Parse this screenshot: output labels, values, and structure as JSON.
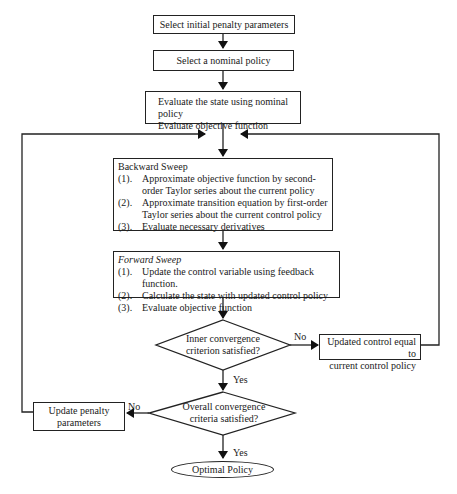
{
  "flowchart": {
    "start": "Select initial penalty parameters",
    "nominal": "Select a nominal policy",
    "evaluate": {
      "line1": "Evaluate the state using nominal policy",
      "line2": "Evaluate objective function"
    },
    "backward": {
      "title": "Backward Sweep",
      "items": [
        {
          "num": "(1).",
          "text": "Approximate objective function by second-order Taylor series about the current policy"
        },
        {
          "num": "(2).",
          "text": "Approximate transition equation by first-order Taylor series about the current control policy"
        },
        {
          "num": "(3).",
          "text": "Evaluate necessary derivatives"
        }
      ]
    },
    "forward": {
      "title": "Forward Sweep",
      "items": [
        {
          "num": "(1).",
          "text": "Update the control variable using feedback function."
        },
        {
          "num": "(2).",
          "text": "Calculate the state with updated control policy"
        },
        {
          "num": "(3).",
          "text": "Evaluate objective function"
        }
      ]
    },
    "inner_decision": {
      "line1": "Inner convergence",
      "line2": "criterion satisfied?"
    },
    "update_control": {
      "line1": "Updated control equal to",
      "line2": "current control policy"
    },
    "overall_decision": {
      "line1": "Overall convergence",
      "line2": "criteria satisfied?"
    },
    "update_penalty": {
      "line1": "Update penalty",
      "line2": "parameters"
    },
    "end": "Optimal Policy",
    "labels": {
      "inner_no": "No",
      "inner_yes": "Yes",
      "overall_no": "No",
      "overall_yes": "Yes"
    }
  }
}
